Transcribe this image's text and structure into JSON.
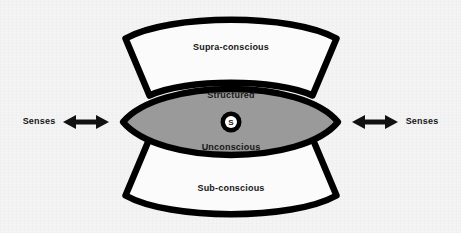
{
  "diagram": {
    "background_color": "#f4f4f4",
    "outline_color": "#000000",
    "lens_fill_color": "#9a9a9a",
    "petal_fill_color": "#fbfbfb",
    "regions": {
      "supra": {
        "label": "Supra-conscious",
        "fill": "#fbfbfb"
      },
      "structured": {
        "label": "Structured"
      },
      "unconscious": {
        "label": "Unconscious"
      },
      "sub": {
        "label": "Sub-conscious",
        "fill": "#fbfbfb"
      }
    },
    "core": {
      "letter": "S",
      "ring_color": "#000000",
      "inner_fill": "#ffffff"
    },
    "senses_left": {
      "label": "Senses",
      "arrow": "double-headed-arrow"
    },
    "senses_right": {
      "label": "Senses",
      "arrow": "double-headed-arrow"
    }
  }
}
